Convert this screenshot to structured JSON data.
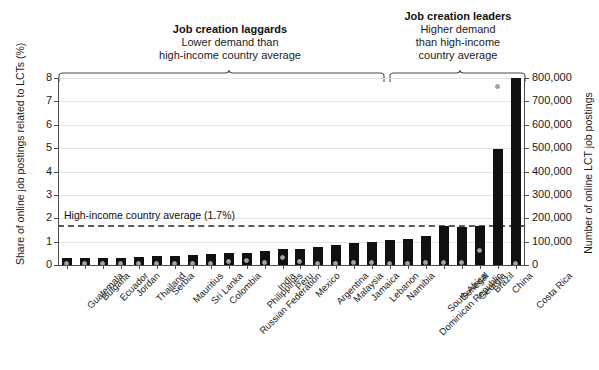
{
  "annotations": {
    "laggards": {
      "title": "Job creation laggards",
      "line1": "Lower demand than",
      "line2": "high-income country average"
    },
    "leaders": {
      "title": "Job creation leaders",
      "line1": "Higher demand",
      "line2": "than high-income",
      "line3": "country average"
    },
    "average_label": "High-income country average (1.7%)"
  },
  "chart_data": {
    "type": "bar",
    "title": "",
    "xlabel": "",
    "ylabel": "Share of online job postings related to LCTs (%)",
    "y2label": "Number of online LCT job postings",
    "ylim": [
      0,
      8
    ],
    "y2lim": [
      0,
      800000
    ],
    "yticks": [
      "0",
      "1",
      "2",
      "3",
      "4",
      "5",
      "6",
      "7",
      "8"
    ],
    "y2ticks": [
      "0",
      "100,000",
      "200,000",
      "300,000",
      "400,000",
      "500,000",
      "600,000",
      "700,000",
      "800,000"
    ],
    "grid": true,
    "legend": "none",
    "reference_line": {
      "label": "High-income country average (1.7%)",
      "value": 1.7,
      "style": "dashed"
    },
    "categories": [
      "Guatemala",
      "Bulgaria",
      "Ecuador",
      "Jordan",
      "Thailand",
      "Serbia",
      "Mauritius",
      "Sri Lanka",
      "Colombia",
      "Russian Federation",
      "Philippines",
      "India",
      "Peru",
      "Mexico",
      "Argentina",
      "Malaysia",
      "Jamaica",
      "Lebanon",
      "Namibia",
      "Dominican Republic",
      "South Africa",
      "Senegal",
      "Georgia",
      "Brazil",
      "China",
      "Costa Rica"
    ],
    "series": [
      {
        "name": "Share of online job postings related to LCTs (%)",
        "axis": "left",
        "unit": "%",
        "type": "bar",
        "color": "#111111",
        "values": [
          0.3,
          0.3,
          0.31,
          0.32,
          0.35,
          0.38,
          0.4,
          0.42,
          0.45,
          0.5,
          0.52,
          0.6,
          0.68,
          0.7,
          0.75,
          0.85,
          0.95,
          1.0,
          1.05,
          1.1,
          1.25,
          1.65,
          1.62,
          1.65,
          1.65,
          1.9
        ]
      },
      {
        "name": "Number of online LCT job postings",
        "axis": "right",
        "unit": "postings",
        "type": "scatter",
        "color": "#a6a6a6",
        "values": [
          3000,
          3000,
          3000,
          3000,
          4000,
          4000,
          5000,
          6000,
          6000,
          11000,
          18000,
          9000,
          28000,
          13000,
          6000,
          6000,
          10000,
          9000,
          6000,
          6000,
          8000,
          10000,
          8000,
          62000,
          760000,
          5000
        ]
      }
    ],
    "group_split_index": 19,
    "large_bars_note": {
      "China_percent": 4.95,
      "CostaRica_percent": 7.98
    }
  }
}
